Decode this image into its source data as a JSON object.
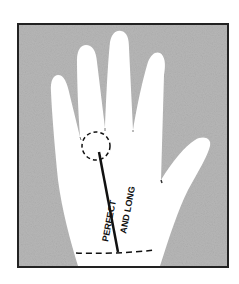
{
  "diagram": {
    "line_label_1": "PERFECT",
    "line_label_2": "AND LONG",
    "colors": {
      "background": "#ffffff",
      "frame_fill": "#b4b4b4",
      "hand": "#ffffff",
      "ink": "#111111"
    }
  }
}
